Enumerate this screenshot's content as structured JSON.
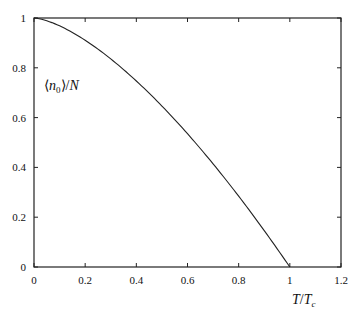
{
  "chart_data": {
    "type": "line",
    "title": "",
    "xlabel": "T/T_c",
    "ylabel": "⟨n₀⟩/N",
    "xlim": [
      0,
      1.2
    ],
    "ylim": [
      0,
      1
    ],
    "grid": false,
    "x_ticks": [
      "0",
      "0.2",
      "0.4",
      "0.6",
      "0.8",
      "1",
      "1.2"
    ],
    "y_ticks": [
      "0",
      "0.2",
      "0.4",
      "0.6",
      "0.8",
      "1"
    ],
    "series": [
      {
        "name": "⟨n₀⟩/N = 1 − (T/T_c)^{3/2}",
        "x": [
          0,
          0.1,
          0.2,
          0.3,
          0.4,
          0.5,
          0.6,
          0.7,
          0.8,
          0.9,
          1.0
        ],
        "y": [
          1.0,
          0.968,
          0.911,
          0.836,
          0.747,
          0.646,
          0.535,
          0.414,
          0.284,
          0.146,
          0.0
        ]
      }
    ]
  },
  "labels": {
    "ylabel_main": "⟨n",
    "ylabel_sub": "0",
    "ylabel_rest": "⟩/N",
    "xlabel_main": "T/T",
    "xlabel_sub": "c"
  }
}
